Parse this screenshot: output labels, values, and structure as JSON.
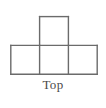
{
  "figure": {
    "caption": "Top",
    "background_color": "#ffffff",
    "line_color": "#6b6b6b",
    "line_width": 1.4,
    "caption_color": "#4a4a4a",
    "grid": {
      "cell_size": 28.8,
      "origin_x": 10.8,
      "origin_y": 16.6,
      "rows": 2,
      "columns": 3,
      "filled_cells": [
        {
          "row": 0,
          "column": 1
        },
        {
          "row": 1,
          "column": 0
        },
        {
          "row": 1,
          "column": 1
        },
        {
          "row": 1,
          "column": 2
        }
      ]
    },
    "segments": [
      {
        "name": "top-square-top-edge",
        "x1": 39.6,
        "y1": 16.6,
        "x2": 68.4,
        "y2": 16.6
      },
      {
        "name": "top-square-left-edge",
        "x1": 39.6,
        "y1": 16.6,
        "x2": 39.6,
        "y2": 45.4
      },
      {
        "name": "top-square-right-edge",
        "x1": 68.4,
        "y1": 16.6,
        "x2": 68.4,
        "y2": 45.4
      },
      {
        "name": "bottom-row-top-edge",
        "x1": 10.8,
        "y1": 45.4,
        "x2": 97.2,
        "y2": 45.4
      },
      {
        "name": "bottom-row-bottom-edge",
        "x1": 10.8,
        "y1": 74.2,
        "x2": 97.2,
        "y2": 74.2
      },
      {
        "name": "bottom-row-left-edge",
        "x1": 10.8,
        "y1": 45.4,
        "x2": 10.8,
        "y2": 74.2
      },
      {
        "name": "bottom-row-right-edge",
        "x1": 97.2,
        "y1": 45.4,
        "x2": 97.2,
        "y2": 74.2
      },
      {
        "name": "bottom-row-divider-left",
        "x1": 39.6,
        "y1": 45.4,
        "x2": 39.6,
        "y2": 74.2
      },
      {
        "name": "bottom-row-divider-right",
        "x1": 68.4,
        "y1": 45.4,
        "x2": 68.4,
        "y2": 74.2
      }
    ]
  }
}
